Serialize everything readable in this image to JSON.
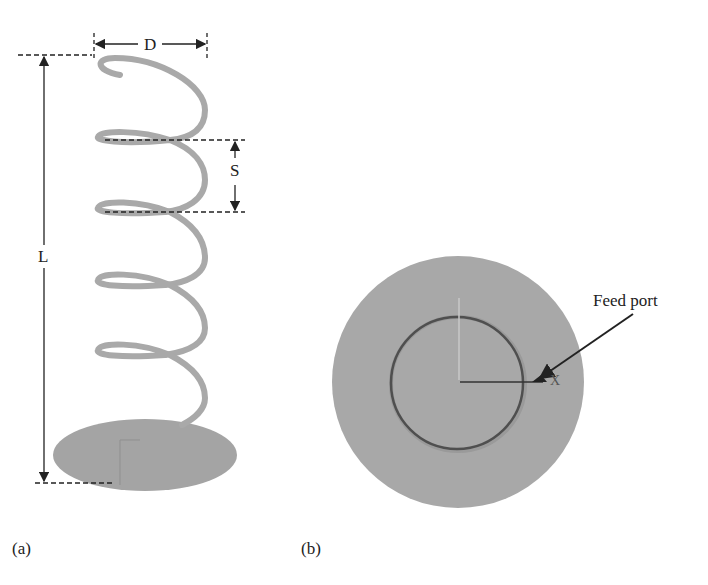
{
  "panel_a": {
    "caption": "(a)",
    "dimension_labels": {
      "diameter": "D",
      "spacing": "S",
      "length": "L"
    }
  },
  "panel_b": {
    "caption": "(b)",
    "annotation": "Feed port",
    "axis_label": "X"
  },
  "colors": {
    "helix": "#a9a9a9",
    "ground_plane": "#a4a4a4",
    "ring": "#555555",
    "lines": "#222222"
  }
}
